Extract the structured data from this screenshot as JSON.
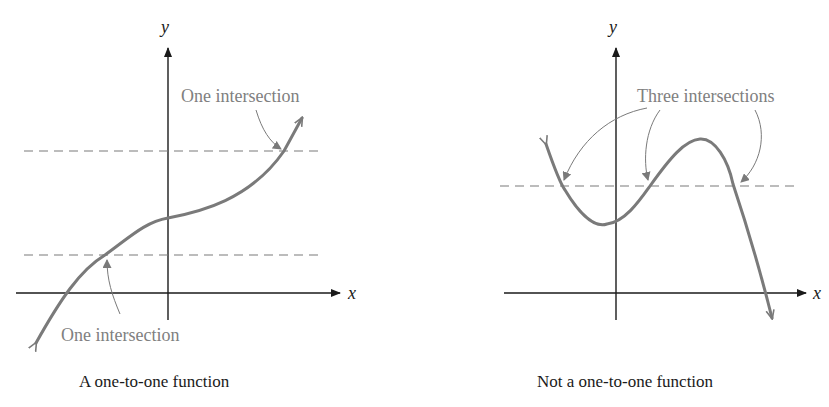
{
  "left_panel": {
    "title": "A one-to-one function",
    "x_axis_label": "x",
    "y_axis_label": "y",
    "annotation_top": "One intersection",
    "annotation_bottom": "One intersection"
  },
  "right_panel": {
    "title": "Not a one-to-one function",
    "x_axis_label": "x",
    "y_axis_label": "y",
    "annotation": "Three intersections"
  },
  "colors": {
    "curve": "#7a7a7a",
    "axis": "#1a1a1a",
    "annotation_text": "#808080"
  }
}
